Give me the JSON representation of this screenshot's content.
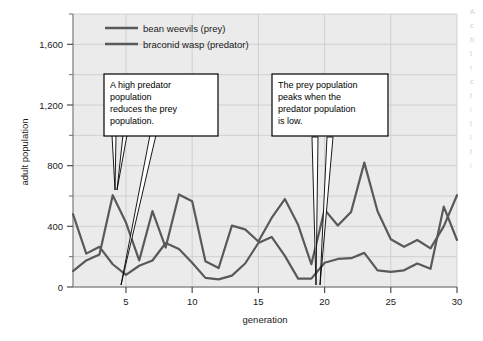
{
  "figure": {
    "background_color": "#ffffff",
    "plot_background_color": "#ebebeb",
    "grid_color": "#c9c9c9",
    "axis_color": "#8c8c8c",
    "series_color": "#58595b"
  },
  "chart_data": {
    "type": "line",
    "title": "",
    "xlabel": "generation",
    "ylabel": "adult population",
    "xlim": [
      1,
      30
    ],
    "ylim": [
      0,
      1800
    ],
    "xticks": [
      5,
      10,
      15,
      20,
      25,
      30
    ],
    "xtick_labels": [
      "5",
      "10",
      "15",
      "20",
      "25",
      "30"
    ],
    "yticks": [
      0,
      400,
      800,
      1200,
      1600
    ],
    "ytick_labels": [
      "0",
      "400",
      "800",
      "1,200",
      "1,600"
    ],
    "yticks_minor": [
      200,
      600,
      1000,
      1400,
      1800
    ],
    "grid": true,
    "legend_position": "top-center",
    "x": [
      1,
      2,
      3,
      4,
      5,
      6,
      7,
      8,
      9,
      10,
      11,
      12,
      13,
      14,
      15,
      16,
      17,
      18,
      19,
      20,
      21,
      22,
      23,
      24,
      25,
      26,
      27,
      28,
      29,
      30
    ],
    "series": [
      {
        "name": "bean weevils (prey)",
        "color": "#58595b",
        "values": [
          480,
          220,
          265,
          150,
          80,
          140,
          175,
          290,
          250,
          160,
          60,
          50,
          75,
          155,
          290,
          330,
          205,
          55,
          55,
          160,
          185,
          190,
          225,
          110,
          100,
          110,
          155,
          120,
          530,
          310
        ]
      },
      {
        "name": "braconid wasp (predator)",
        "color": "#58595b",
        "values": [
          105,
          175,
          215,
          605,
          425,
          175,
          500,
          260,
          610,
          565,
          170,
          125,
          405,
          380,
          300,
          455,
          580,
          410,
          150,
          510,
          405,
          495,
          820,
          500,
          315,
          265,
          310,
          255,
          400,
          605
        ]
      }
    ],
    "annotations": [
      {
        "id": "callout-left",
        "text": "A high predator population reduces the prey population.",
        "lines": [
          "A high predator",
          "population",
          "reduces the prey",
          "population."
        ],
        "points_to": [
          "generation 4 predator peak",
          "generation 5 prey minimum"
        ]
      },
      {
        "id": "callout-right",
        "text": "The prey population peaks when the predator population is low.",
        "lines": [
          "The prey population",
          "peaks when the",
          "predator population",
          "is low."
        ],
        "points_to": [
          "generation 19 predator minimum",
          "generation 20 predator rise"
        ]
      }
    ]
  },
  "legend": {
    "items": [
      {
        "label": "bean weevils (prey)",
        "color": "#58595b"
      },
      {
        "label": "braconid wasp (predator)",
        "color": "#58595b"
      }
    ]
  },
  "edge_text": {
    "fragments": [
      "A",
      "c",
      "b",
      "t",
      "r",
      "c",
      "t",
      "i",
      "t",
      "l",
      "t",
      "i"
    ]
  }
}
